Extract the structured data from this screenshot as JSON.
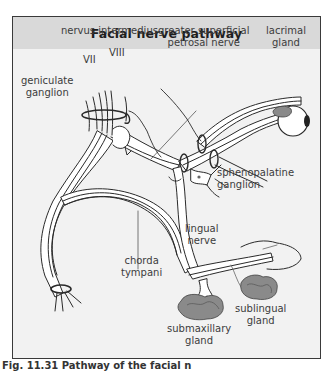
{
  "figure": {
    "title": "Facial nerve pathway",
    "caption": "Fig. 11.31 Pathway of the facial n",
    "colors": {
      "frame_border": "#3a3a3a",
      "header_bg": "#d9d9d9",
      "panel_bg": "#f2f2f2",
      "nerve_fill": "#ffffff",
      "nerve_stroke": "#2a2a2a",
      "gland_fill": "#8a8a8a",
      "label_text": "#3c3c3c"
    }
  },
  "labels": {
    "nervus_intermedius": "nervus intermedius",
    "vii": "VII",
    "viii": "VIII",
    "geniculate_ganglion": [
      "geniculate",
      "ganglion"
    ],
    "greater_superficial_petrosal_nerve": [
      "greater superficial",
      "petrosal nerve"
    ],
    "lacrimal_gland": [
      "lacrimal",
      "gland"
    ],
    "sphenopalatine_ganglion": [
      "sphenopalatine",
      "ganglion"
    ],
    "chorda_tympani": [
      "chorda",
      "tympani"
    ],
    "lingual_nerve": [
      "lingual",
      "nerve"
    ],
    "sublingual_gland": [
      "sublingual",
      "gland"
    ],
    "submaxillary_gland": [
      "submaxillary",
      "gland"
    ]
  }
}
